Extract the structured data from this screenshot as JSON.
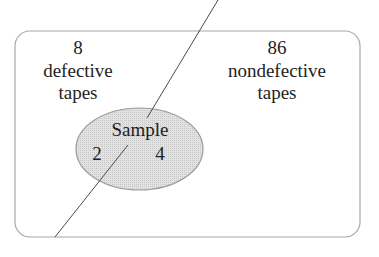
{
  "diagram": {
    "type": "venn",
    "universe": {
      "left_region": {
        "count": "8",
        "line1": "defective",
        "line2": "tapes"
      },
      "right_region": {
        "count": "86",
        "line1": "nondefective",
        "line2": "tapes"
      }
    },
    "sample": {
      "label": "Sample",
      "left_count": "2",
      "right_count": "4",
      "fill_color": "#dcdcdc"
    },
    "colors": {
      "border": "#a8a8a8",
      "divider": "#4a4a4a",
      "text": "#1e1e1e"
    }
  }
}
